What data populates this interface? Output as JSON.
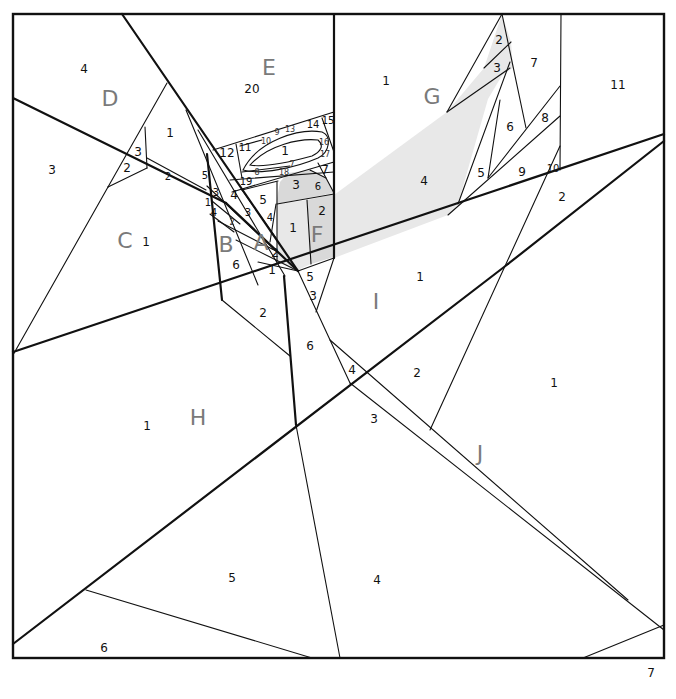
{
  "diagram": {
    "type": "foundation-paper-piecing-pattern",
    "colors": {
      "line": "#111111",
      "shade": "#d9d9d9",
      "shade_light": "#e8e8e8",
      "section_label": "#7a7a7a",
      "background": "#ffffff"
    },
    "sections": {
      "A": {
        "label": "A",
        "pieces": [
          "1",
          "2",
          "3",
          "4",
          "5"
        ]
      },
      "B": {
        "label": "B",
        "pieces": [
          "1",
          "2",
          "3",
          "4",
          "5",
          "6"
        ]
      },
      "C": {
        "label": "C",
        "pieces": [
          "1",
          "2",
          "3"
        ]
      },
      "D": {
        "label": "D",
        "pieces": [
          "1",
          "2",
          "3",
          "4"
        ]
      },
      "E": {
        "label": "E",
        "pieces": [
          "1",
          "2",
          "3",
          "4",
          "5",
          "6",
          "7",
          "8",
          "9",
          "10",
          "11",
          "12",
          "13",
          "14",
          "15",
          "16",
          "17",
          "18",
          "19",
          "20"
        ]
      },
      "F": {
        "label": "F",
        "pieces": [
          "1",
          "2",
          "3",
          "4",
          "5",
          "6",
          "7"
        ]
      },
      "G": {
        "label": "G",
        "pieces": [
          "1",
          "2",
          "3",
          "4",
          "5",
          "6",
          "7",
          "8",
          "9",
          "10",
          "11"
        ]
      },
      "H": {
        "label": "H",
        "pieces": [
          "1",
          "2",
          "3",
          "4",
          "5",
          "6",
          "7"
        ]
      },
      "I": {
        "label": "I",
        "pieces": [
          "1",
          "2",
          "3",
          "4",
          "5",
          "6"
        ]
      },
      "J": {
        "label": "J",
        "pieces": [
          "1",
          "2"
        ]
      }
    },
    "labels": {
      "sec_D": "D",
      "sec_E": "E",
      "sec_G": "G",
      "sec_C": "C",
      "sec_B": "B",
      "sec_A": "A",
      "sec_F": "F",
      "sec_I": "I",
      "sec_H": "H",
      "sec_J": "J",
      "d4": "4",
      "e20": "20",
      "g1": "1",
      "g2": "2",
      "g3": "3",
      "g7": "7",
      "g11": "11",
      "g6": "6",
      "g8": "8",
      "g4": "4",
      "g5": "5",
      "g9": "9",
      "g10": "10",
      "j2": "2",
      "d1": "1",
      "d3": "3",
      "d2": "2",
      "c3": "3",
      "c2": "2",
      "c1": "1",
      "e12": "12",
      "e11": "11",
      "e9": "9",
      "e13": "13",
      "e14": "14",
      "e15": "15",
      "e10": "10",
      "e1": "1",
      "e16": "16",
      "e17": "17",
      "e8": "8",
      "e18": "18",
      "e19": "19",
      "e7": "7",
      "b5": "5",
      "b3": "3",
      "b1": "1",
      "b4": "4",
      "b2": "2",
      "b6": "6",
      "a4": "4",
      "a3": "3",
      "a2": "2",
      "a1": "1",
      "a5": "5",
      "f3": "3",
      "f6": "6",
      "f7": "7",
      "f5": "5",
      "f4": "4",
      "f1": "1",
      "f2": "2",
      "i5": "5",
      "i3": "3",
      "i1": "1",
      "i6": "6",
      "i4": "4",
      "i2": "2",
      "h2": "2",
      "h1": "1",
      "h3": "3",
      "h5": "5",
      "h4": "4",
      "h6": "6",
      "h7": "7",
      "j1": "1"
    }
  }
}
